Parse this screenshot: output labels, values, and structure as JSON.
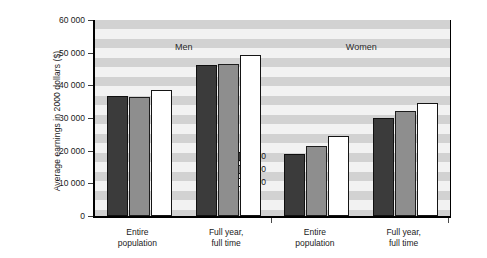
{
  "chart_data": {
    "type": "bar",
    "title": "",
    "xlabel": "",
    "ylabel": "Average earnings in 2000 dollars ($)",
    "ylim": [
      0,
      60000
    ],
    "ytick_values": [
      0,
      10000,
      20000,
      30000,
      40000,
      50000,
      60000
    ],
    "ytick_labels": [
      "0",
      "10 000",
      "20 000",
      "30 000",
      "40 000",
      "50 000",
      "60 000"
    ],
    "grid": "horizontal-bands",
    "legend_position": "inside-center-lower",
    "group_headings": [
      "Men",
      "Women"
    ],
    "categories": [
      "Entire population",
      "Full year, full time",
      "Entire population",
      "Full year, full time"
    ],
    "category_labels": [
      {
        "line1": "Entire",
        "line2": "population"
      },
      {
        "line1": "Full year,",
        "line2": "full time"
      },
      {
        "line1": "Entire",
        "line2": "population"
      },
      {
        "line1": "Full year,",
        "line2": "full time"
      }
    ],
    "series": [
      {
        "name": "1980",
        "color": "#3b3b3b",
        "values": [
          36800,
          46200,
          19000,
          29900
        ]
      },
      {
        "name": "1990",
        "color": "#8e8e8e",
        "values": [
          36300,
          46600,
          21500,
          32000
        ]
      },
      {
        "name": "2000",
        "color": "#ffffff",
        "values": [
          38700,
          49200,
          24600,
          34700
        ]
      }
    ]
  },
  "legend": {
    "items": [
      {
        "label": "1980"
      },
      {
        "label": "1990"
      },
      {
        "label": "2000"
      }
    ]
  },
  "axis": {
    "y_title": "Average earnings in 2000 dollars ($)"
  }
}
